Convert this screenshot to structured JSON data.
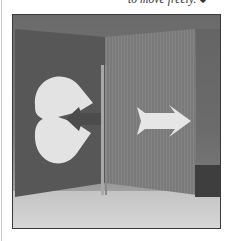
{
  "page": {
    "caption_fragment": "to move freely.",
    "end_mark": "◆"
  },
  "figure": {
    "elements": [
      "heart-cutout",
      "arrow-left",
      "arrow-right",
      "center-divider",
      "left-panel",
      "right-panel"
    ],
    "colors": {
      "background_top": "#6c6c6c",
      "left_panel": "#575757",
      "right_panel": "#7a7a7a",
      "shapes": "#e4e4e4",
      "surface": "#c9c9c9",
      "frame": "#3a3a3a"
    }
  }
}
